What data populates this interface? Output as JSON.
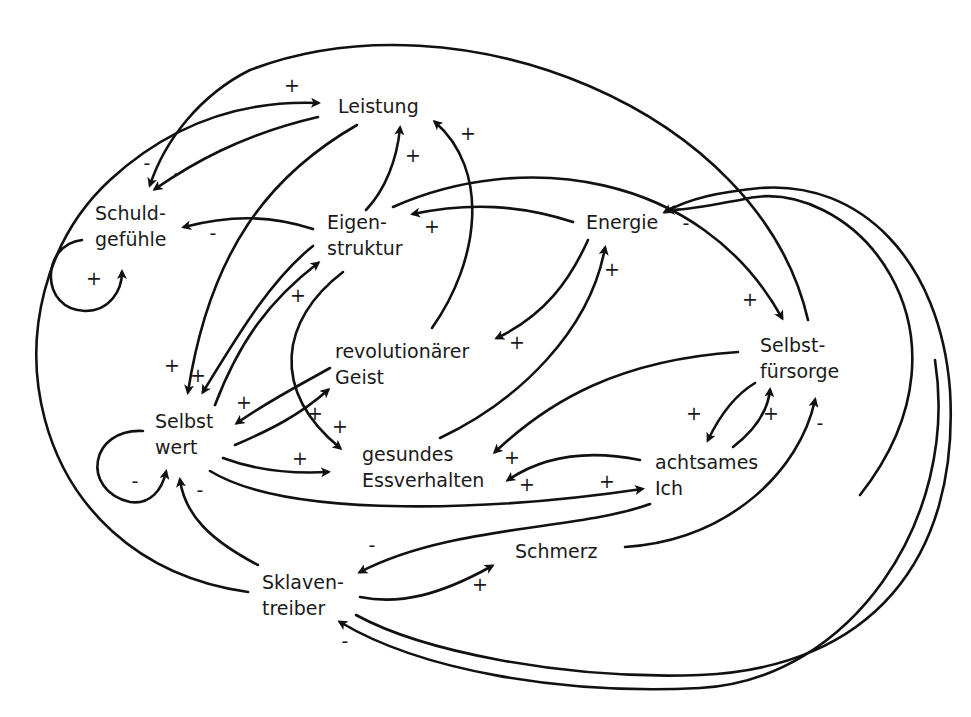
{
  "diagram": {
    "type": "causal-loop-diagram",
    "language": "de",
    "nodes": [
      {
        "id": "leistung",
        "lines": [
          "Leistung"
        ],
        "x": 338,
        "y": 113
      },
      {
        "id": "schuldgefuehle",
        "lines": [
          "Schuld-",
          "gefühle"
        ],
        "x": 95,
        "y": 220
      },
      {
        "id": "eigenstruktur",
        "lines": [
          "Eigen-",
          "struktur"
        ],
        "x": 327,
        "y": 229
      },
      {
        "id": "energie",
        "lines": [
          "Energie"
        ],
        "x": 586,
        "y": 229
      },
      {
        "id": "revolutionaerer_geist",
        "lines": [
          "revolutionärer",
          "Geist"
        ],
        "x": 335,
        "y": 358
      },
      {
        "id": "selbstfuersorge",
        "lines": [
          "Selbst-",
          "fürsorge"
        ],
        "x": 760,
        "y": 352
      },
      {
        "id": "selbstwert",
        "lines": [
          "Selbst",
          "wert"
        ],
        "x": 155,
        "y": 428
      },
      {
        "id": "gesundes_essverhalten",
        "lines": [
          "gesundes",
          "Essverhalten"
        ],
        "x": 362,
        "y": 461
      },
      {
        "id": "achtsames_ich",
        "lines": [
          "achtsames",
          "Ich"
        ],
        "x": 655,
        "y": 469
      },
      {
        "id": "schmerz",
        "lines": [
          "Schmerz"
        ],
        "x": 515,
        "y": 558
      },
      {
        "id": "sklaventreiber",
        "lines": [
          "Sklaven-",
          "treiber"
        ],
        "x": 262,
        "y": 589
      }
    ],
    "edges": [
      {
        "from": "sklaventreiber",
        "to": "leistung",
        "polarity": "+",
        "d": "M 248 592 C 20 560, -20 300, 110 180 C 170 125, 240 100, 318 103",
        "pol_x": 292,
        "pol_y": 92
      },
      {
        "from": "leistung",
        "to": "schuldgefuehle",
        "polarity": "-",
        "d": "M 318 117 C 240 135, 190 165, 155 189",
        "pol_x": 177,
        "pol_y": 180
      },
      {
        "from": "selbstfuersorge",
        "to": "schuldgefuehle",
        "polarity": "-",
        "d": "M 808 320 C 760 110, 460 -10, 250 70 C 200 95, 165 140, 150 185",
        "pol_x": 147,
        "pol_y": 170
      },
      {
        "from": "eigenstruktur",
        "to": "schuldgefuehle",
        "polarity": "-",
        "d": "M 313 229 C 270 215, 230 215, 184 227",
        "pol_x": 213,
        "pol_y": 240
      },
      {
        "from": "schuldgefuehle",
        "to": "schuldgefuehle",
        "polarity": "+",
        "d": "M 82 240 C 40 245, 40 310, 85 311 C 110 311, 122 290, 122 272",
        "pol_x": 94,
        "pol_y": 285
      },
      {
        "from": "leistung",
        "to": "selbstwert",
        "polarity": "+",
        "d": "M 357 125 C 270 175, 210 250, 188 392",
        "pol_x": 172,
        "pol_y": 372
      },
      {
        "from": "eigenstruktur",
        "to": "leistung",
        "polarity": "+",
        "d": "M 366 210 C 385 190, 397 160, 400 128",
        "pol_x": 413,
        "pol_y": 162
      },
      {
        "from": "revolutionaerer_geist",
        "to": "leistung",
        "polarity": "+",
        "d": "M 432 328 C 480 260, 490 170, 435 122",
        "pol_x": 468,
        "pol_y": 140
      },
      {
        "from": "eigenstruktur",
        "to": "selbstwert",
        "polarity": "+",
        "d": "M 313 246 C 270 280, 235 340, 203 392",
        "pol_x": 198,
        "pol_y": 382
      },
      {
        "from": "selbstwert",
        "to": "eigenstruktur",
        "polarity": "+",
        "d": "M 215 405 C 240 340, 270 300, 318 263",
        "pol_x": 298,
        "pol_y": 302
      },
      {
        "from": "eigenstruktur",
        "to": "gesundes_essverhalten",
        "polarity": "+",
        "d": "M 343 272 C 280 320, 270 390, 340 448",
        "pol_x": 340,
        "pol_y": 433
      },
      {
        "from": "energie",
        "to": "eigenstruktur",
        "polarity": "+",
        "d": "M 573 222 C 520 205, 470 202, 413 214",
        "pol_x": 432,
        "pol_y": 233
      },
      {
        "from": "eigenstruktur",
        "to": "selbstfuersorge",
        "polarity": "+",
        "d": "M 393 207 C 520 150, 700 170, 782 318",
        "pol_x": 750,
        "pol_y": 306
      },
      {
        "from": "selbstfuersorge",
        "to": "energie",
        "polarity": "-",
        "d": "M 860 495 C 990 330, 850 170, 740 200 C 710 205, 690 210, 668 210",
        "pol_x": 686,
        "pol_y": 230
      },
      {
        "from": "energie",
        "to": "revolutionaerer_geist",
        "polarity": "+",
        "d": "M 588 240 C 570 280, 545 315, 497 338",
        "pol_x": 517,
        "pol_y": 349
      },
      {
        "from": "gesundes_essverhalten",
        "to": "energie",
        "polarity": "+",
        "d": "M 440 438 C 520 400, 590 330, 605 248",
        "pol_x": 612,
        "pol_y": 276
      },
      {
        "from": "revolutionaerer_geist",
        "to": "selbstwert",
        "polarity": "+",
        "d": "M 330 368 C 300 385, 270 400, 237 423",
        "pol_x": 244,
        "pol_y": 409
      },
      {
        "from": "selbstwert",
        "to": "revolutionaerer_geist",
        "polarity": "+",
        "d": "M 235 445 C 270 430, 300 415, 328 390",
        "pol_x": 315,
        "pol_y": 420
      },
      {
        "from": "selbstwert",
        "to": "gesundes_essverhalten",
        "polarity": "+",
        "d": "M 223 458 C 255 470, 290 474, 328 472",
        "pol_x": 300,
        "pol_y": 465
      },
      {
        "from": "selbstwert",
        "to": "achtsames_ich",
        "polarity": "+",
        "d": "M 210 471 C 290 520, 500 510, 642 489",
        "pol_x": 607,
        "pol_y": 488
      },
      {
        "from": "selbstwert",
        "to": "selbstwert",
        "polarity": "-",
        "d": "M 143 431 C 90 428, 80 490, 130 502 C 150 505, 162 490, 166 472",
        "pol_x": 135,
        "pol_y": 488
      },
      {
        "from": "sklaventreiber",
        "to": "selbstwert",
        "polarity": "-",
        "d": "M 258 565 C 210 540, 185 515, 180 480",
        "pol_x": 200,
        "pol_y": 497
      },
      {
        "from": "selbstfuersorge",
        "to": "gesundes_essverhalten",
        "polarity": "+",
        "d": "M 738 352 C 620 360, 550 400, 495 452",
        "pol_x": 512,
        "pol_y": 464
      },
      {
        "from": "achtsames_ich",
        "to": "gesundes_essverhalten",
        "polarity": "+",
        "d": "M 640 460 C 590 450, 545 455, 508 480",
        "pol_x": 527,
        "pol_y": 491
      },
      {
        "from": "selbstfuersorge",
        "to": "achtsames_ich",
        "polarity": "+",
        "d": "M 755 383 C 735 395, 720 415, 708 440",
        "pol_x": 694,
        "pol_y": 420
      },
      {
        "from": "achtsames_ich",
        "to": "selbstfuersorge",
        "polarity": "+",
        "d": "M 733 447 C 755 430, 768 410, 770 390",
        "pol_x": 771,
        "pol_y": 420
      },
      {
        "from": "schmerz",
        "to": "selbstfuersorge",
        "polarity": "-",
        "d": "M 625 547 C 730 540, 800 470, 815 400",
        "pol_x": 820,
        "pol_y": 430
      },
      {
        "from": "achtsames_ich",
        "to": "sklaventreiber",
        "polarity": "-",
        "d": "M 650 504 C 580 530, 450 525, 360 572",
        "pol_x": 372,
        "pol_y": 552
      },
      {
        "from": "sklaventreiber",
        "to": "schmerz",
        "polarity": "+",
        "d": "M 360 597 C 400 605, 440 595, 492 566",
        "pol_x": 480,
        "pol_y": 591
      },
      {
        "from": "sklaventreiber",
        "to": "energie",
        "polarity": "",
        "d": "M 356 615 C 420 650, 560 680, 700 675 C 870 668, 960 560, 950 390 C 940 260, 860 180, 760 188 C 720 192, 690 198, 665 212",
        "pol_x": 0,
        "pol_y": 0
      },
      {
        "from": "selbstfuersorge",
        "to": "sklaventreiber",
        "polarity": "-",
        "d": "M 935 360 C 960 520, 850 680, 700 688 C 560 695, 420 670, 340 622",
        "pol_x": 345,
        "pol_y": 648
      }
    ]
  }
}
